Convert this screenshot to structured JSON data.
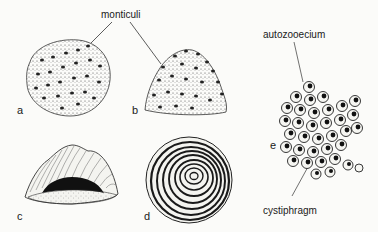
{
  "figure": {
    "labels": {
      "monticuli": "monticuli",
      "autozooecium": "autozooecium",
      "cystiphragm": "cystiphragm"
    },
    "panels": [
      {
        "letter": "a",
        "description": "rounded massive colony with monticuli (stippled)"
      },
      {
        "letter": "b",
        "description": "domed colony with monticuli on surface"
      },
      {
        "letter": "c",
        "description": "hemispherical colony, ribbed exterior with dark concave base"
      },
      {
        "letter": "d",
        "description": "concentric growth layers, circular cross section"
      },
      {
        "letter": "e",
        "description": "cluster of autozooecia with cystiphragms"
      }
    ],
    "colors": {
      "background": "#fbfbf9",
      "ink": "#1a1a1a",
      "stipple": "#555555"
    }
  }
}
